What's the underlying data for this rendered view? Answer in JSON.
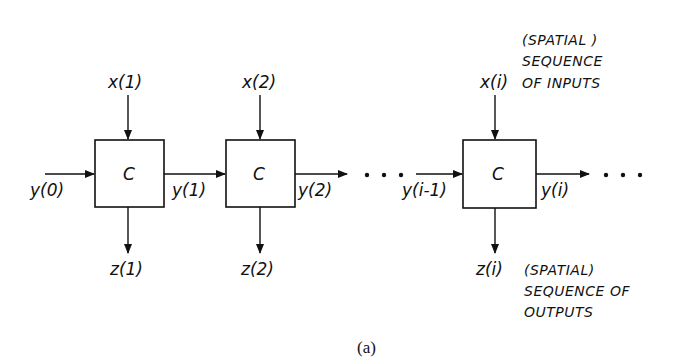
{
  "diagram": {
    "cells": [
      {
        "label": "C",
        "input": "x(1)",
        "output": "z(1)",
        "left": "y(0)",
        "right": "y(1)"
      },
      {
        "label": "C",
        "input": "x(2)",
        "output": "z(2)",
        "left": "y(1)",
        "right": "y(2)"
      },
      {
        "label": "C",
        "input": "x(i)",
        "output": "z(i)",
        "left": "y(i-1)",
        "right": "y(i)"
      }
    ],
    "labels": {
      "y0": "y(0)",
      "y1": "y(1)",
      "y2": "y(2)",
      "yim1": "y(i-1)",
      "yi": "y(i)",
      "x1": "x(1)",
      "x2": "x(2)",
      "xi": "x(i)",
      "z1": "z(1)",
      "z2": "z(2)",
      "zi": "z(i)"
    },
    "inputs_note": [
      "(SPATIAL )",
      "SEQUENCE",
      "OF INPUTS"
    ],
    "outputs_note": [
      "(SPATIAL)",
      "SEQUENCE OF",
      "OUTPUTS"
    ],
    "caption": "(a)"
  }
}
